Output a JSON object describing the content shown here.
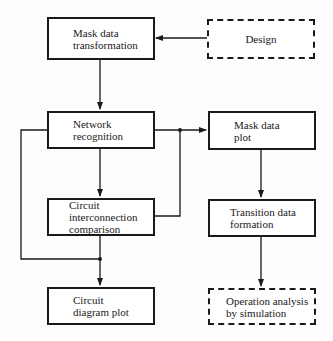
{
  "diagram": {
    "nodes": [
      {
        "id": "mask-data-transformation",
        "label": "Mask data\ntransformation",
        "style": "solid"
      },
      {
        "id": "design",
        "label": "Design",
        "style": "dashed"
      },
      {
        "id": "network-recognition",
        "label": "Network\nrecognition",
        "style": "solid"
      },
      {
        "id": "mask-data-plot",
        "label": "Mask data\nplot",
        "style": "solid"
      },
      {
        "id": "circuit-interconnection-comparison",
        "label": "Circuit\ninterconnection\ncomparison",
        "style": "solid"
      },
      {
        "id": "transition-data-formation",
        "label": "Transition data\nformation",
        "style": "solid"
      },
      {
        "id": "circuit-diagram-plot",
        "label": "Circuit\ndiagram plot",
        "style": "solid"
      },
      {
        "id": "operation-analysis-by-simulation",
        "label": "Operation analysis\nby simulation",
        "style": "dashed"
      }
    ],
    "edges": [
      {
        "from": "design",
        "to": "mask-data-transformation"
      },
      {
        "from": "mask-data-transformation",
        "to": "network-recognition"
      },
      {
        "from": "network-recognition",
        "to": "mask-data-plot"
      },
      {
        "from": "circuit-interconnection-comparison",
        "to": "mask-data-plot"
      },
      {
        "from": "network-recognition",
        "to": "circuit-interconnection-comparison"
      },
      {
        "from": "circuit-interconnection-comparison",
        "to": "circuit-diagram-plot"
      },
      {
        "from": "network-recognition",
        "to": "circuit-diagram-plot"
      },
      {
        "from": "mask-data-plot",
        "to": "transition-data-formation"
      },
      {
        "from": "transition-data-formation",
        "to": "operation-analysis-by-simulation"
      }
    ],
    "colors": {
      "line": "#1a1a1a",
      "background": "#fdfdfd"
    }
  }
}
